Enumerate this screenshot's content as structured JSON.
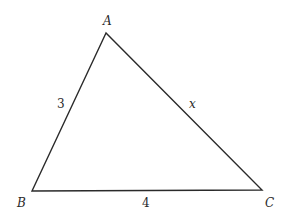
{
  "diagram": {
    "type": "triangle",
    "vertices": [
      {
        "name": "A",
        "label": "A",
        "x": 106,
        "y": 33
      },
      {
        "name": "B",
        "label": "B",
        "x": 32,
        "y": 191
      },
      {
        "name": "C",
        "label": "C",
        "x": 262,
        "y": 190
      }
    ],
    "sides": [
      {
        "from": "A",
        "to": "B",
        "label": "3"
      },
      {
        "from": "B",
        "to": "C",
        "label": "4"
      },
      {
        "from": "A",
        "to": "C",
        "label": "x"
      }
    ],
    "stroke_color": "#2a2a2a"
  }
}
